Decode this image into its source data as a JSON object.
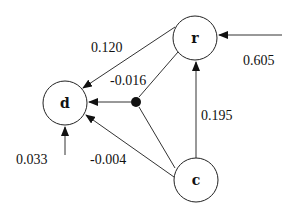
{
  "nodes": {
    "d": {
      "label": "d",
      "cx": 65,
      "cy": 103,
      "r": 22
    },
    "r": {
      "label": "r",
      "cx": 195,
      "cy": 38,
      "r": 22
    },
    "c": {
      "label": "c",
      "cx": 196,
      "cy": 180,
      "r": 22
    },
    "junction": {
      "cx": 136,
      "cy": 102,
      "r": 5
    }
  },
  "edges": {
    "r_to_d": {
      "label": "0.120"
    },
    "junction_to_d": {
      "label": "-0.016"
    },
    "external_to_r": {
      "label": "0.605"
    },
    "c_to_r": {
      "label": "0.195"
    },
    "external_to_d": {
      "label": "0.033"
    },
    "c_to_d": {
      "label": "-0.004"
    }
  },
  "colors": {
    "line": "#333333",
    "text": "#111111",
    "background": "#ffffff"
  }
}
